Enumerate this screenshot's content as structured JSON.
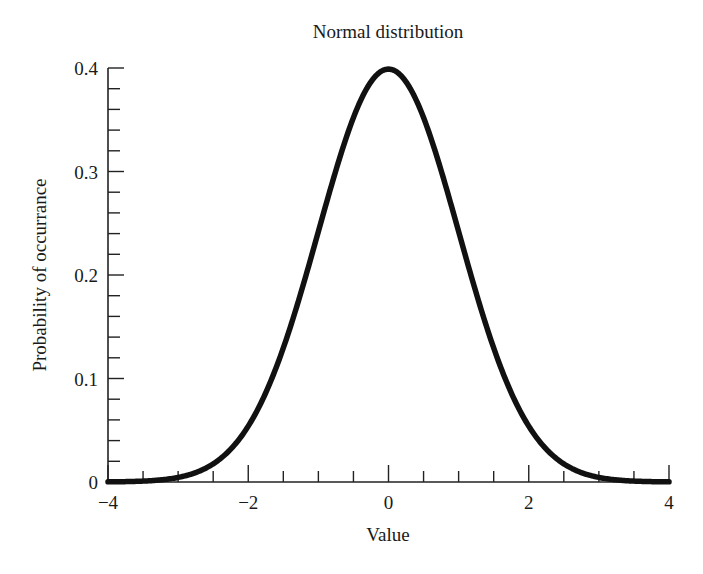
{
  "chart_data": {
    "type": "line",
    "title": "Normal distribution",
    "xlabel": "Value",
    "ylabel": "Probability of occurrance",
    "xlim": [
      -4,
      4
    ],
    "ylim": [
      0,
      0.4
    ],
    "x_ticks_major": [
      -4,
      -2,
      0,
      2,
      4
    ],
    "x_tick_labels": [
      "−4",
      "−2",
      "0",
      "2",
      "4"
    ],
    "x_ticks_minor_step": 0.5,
    "y_ticks_major": [
      0,
      0.1,
      0.2,
      0.3,
      0.4
    ],
    "y_tick_labels": [
      "0",
      "0.1",
      "0.2",
      "0.3",
      "0.4"
    ],
    "y_ticks_minor_step": 0.02,
    "grid": false,
    "legend": null,
    "series": [
      {
        "name": "Standard normal PDF (mean 0, sd 1)",
        "color": "#111111",
        "x": [
          -4,
          -3.5,
          -3,
          -2.5,
          -2,
          -1.5,
          -1,
          -0.5,
          0,
          0.5,
          1,
          1.5,
          2,
          2.5,
          3,
          3.5,
          4
        ],
        "y": [
          0.0001,
          0.0009,
          0.0044,
          0.0175,
          0.054,
          0.1295,
          0.242,
          0.3521,
          0.3989,
          0.3521,
          0.242,
          0.1295,
          0.054,
          0.0175,
          0.0044,
          0.0009,
          0.0001
        ]
      }
    ]
  }
}
